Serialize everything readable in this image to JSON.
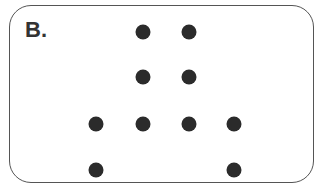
{
  "panel": {
    "label": "B.",
    "dot_color": "#2b2b2b",
    "dots": [
      {
        "x": 143,
        "y": 32
      },
      {
        "x": 189,
        "y": 32
      },
      {
        "x": 143,
        "y": 77
      },
      {
        "x": 189,
        "y": 77
      },
      {
        "x": 96,
        "y": 124
      },
      {
        "x": 143,
        "y": 124
      },
      {
        "x": 189,
        "y": 124
      },
      {
        "x": 234,
        "y": 124
      },
      {
        "x": 96,
        "y": 170
      },
      {
        "x": 234,
        "y": 170
      }
    ]
  }
}
